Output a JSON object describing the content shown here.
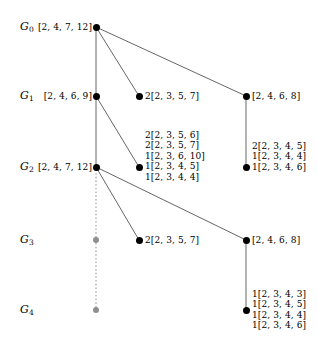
{
  "figure": {
    "type": "lattice-tree-diagram",
    "width": 317,
    "height": 351,
    "colors": {
      "node": "#000000",
      "ghost_node": "#8f8f8f",
      "edge": "#555555",
      "dotted_edge": "#b0b0b0",
      "background": "#ffffff",
      "text": "#000000"
    }
  },
  "levels": [
    {
      "name": "G",
      "sub": "0",
      "y": 27
    },
    {
      "name": "G",
      "sub": "1",
      "y": 96
    },
    {
      "name": "G",
      "sub": "2",
      "y": 167
    },
    {
      "name": "G",
      "sub": "3",
      "y": 240
    },
    {
      "name": "G",
      "sub": "4",
      "y": 310
    }
  ],
  "nodes": {
    "g0_left": {
      "x": 96,
      "y": 27,
      "kind": "solid",
      "label": "[2, 4, 7, 12]",
      "side": "right"
    },
    "g1_left": {
      "x": 96,
      "y": 96,
      "kind": "solid",
      "label": "[2, 4, 6, 9]",
      "side": "right"
    },
    "g1_mid": {
      "x": 139,
      "y": 96,
      "kind": "solid",
      "label": "2[2, 3, 5, 7]",
      "side": "left"
    },
    "g1_right": {
      "x": 246,
      "y": 96,
      "kind": "solid",
      "label": "[2, 4, 6, 8]",
      "side": "left"
    },
    "g2_left": {
      "x": 96,
      "y": 167,
      "kind": "solid",
      "label": "[2, 4, 7, 12]",
      "side": "right"
    },
    "g2_mid": {
      "x": 139,
      "y": 167,
      "kind": "solid",
      "label": "",
      "side": "left"
    },
    "g2_right": {
      "x": 246,
      "y": 167,
      "kind": "solid",
      "label": "",
      "side": "left"
    },
    "g3_left": {
      "x": 96,
      "y": 240,
      "kind": "ghost",
      "label": "",
      "side": "left"
    },
    "g3_mid": {
      "x": 139,
      "y": 240,
      "kind": "solid",
      "label": "2[2, 3, 5, 7]",
      "side": "left"
    },
    "g3_right": {
      "x": 246,
      "y": 240,
      "kind": "solid",
      "label": "[2, 4, 6, 8]",
      "side": "left"
    },
    "g4_left": {
      "x": 96,
      "y": 310,
      "kind": "ghost",
      "label": "",
      "side": "left"
    },
    "g4_right": {
      "x": 246,
      "y": 310,
      "kind": "solid",
      "label": "",
      "side": "left"
    }
  },
  "stacks": {
    "g2_mid_lines": [
      "2[2, 3, 5, 6]",
      "2[2, 3, 5, 7]",
      "1[2, 3, 6, 10]",
      "1[2, 3, 4, 5]",
      "1[2, 3, 4, 4]"
    ],
    "g2_right_lines": [
      "2[2, 3, 4, 5]",
      "1[2, 3, 4, 4]",
      "1[2, 3, 4, 6]"
    ],
    "g4_right_lines": [
      "1[2, 3, 4, 3]",
      "1[2, 3, 4, 5]",
      "1[2, 3, 4, 4]",
      "1[2, 3, 4, 6]"
    ]
  },
  "edges": [
    {
      "from": "g0_left",
      "to": "g1_left",
      "style": "solid"
    },
    {
      "from": "g0_left",
      "to": "g1_mid",
      "style": "solid"
    },
    {
      "from": "g0_left",
      "to": "g1_right",
      "style": "solid"
    },
    {
      "from": "g1_left",
      "to": "g2_left",
      "style": "solid"
    },
    {
      "from": "g1_left",
      "to": "g2_mid",
      "style": "solid"
    },
    {
      "from": "g1_right",
      "to": "g2_right",
      "style": "solid"
    },
    {
      "from": "g2_left",
      "to": "g3_mid",
      "style": "solid"
    },
    {
      "from": "g2_left",
      "to": "g3_right",
      "style": "solid"
    },
    {
      "from": "g2_left",
      "to": "g3_left",
      "style": "dotted"
    },
    {
      "from": "g3_left",
      "to": "g4_left",
      "style": "dotted"
    },
    {
      "from": "g3_right",
      "to": "g4_right",
      "style": "solid"
    }
  ]
}
